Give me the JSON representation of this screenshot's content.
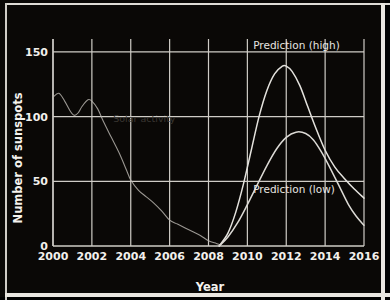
{
  "chart_data": {
    "type": "line",
    "title": "",
    "xlabel": "Year",
    "ylabel": "Number of sunspots",
    "xlim": [
      2000,
      2016
    ],
    "ylim": [
      0,
      160
    ],
    "xticks": [
      "2000",
      "2002",
      "2004",
      "2006",
      "2008",
      "2010",
      "2012",
      "2014",
      "2016"
    ],
    "xtick_values": [
      2000,
      2002,
      2004,
      2006,
      2008,
      2010,
      2012,
      2014,
      2016
    ],
    "yticks": [
      "0",
      "50",
      "100",
      "150"
    ],
    "ytick_values": [
      0,
      50,
      100,
      150
    ],
    "grid": true,
    "legend": "inline-annotations",
    "series": [
      {
        "name": "Solar activity",
        "color": "#b9b6b0",
        "annotation": "Solar activity",
        "annotation_x": 2003.1,
        "annotation_y": 96,
        "x": [
          2000.0,
          2000.3,
          2000.6,
          2000.9,
          2001.1,
          2001.3,
          2001.5,
          2001.8,
          2002.0,
          2002.3,
          2002.6,
          2003.0,
          2003.4,
          2003.8,
          2004.0,
          2004.4,
          2004.8,
          2005.2,
          2005.6,
          2006.0,
          2006.4,
          2006.8,
          2007.2,
          2007.6,
          2008.0,
          2008.4,
          2008.6
        ],
        "y": [
          115,
          118,
          112,
          104,
          101,
          103,
          108,
          113,
          112,
          106,
          96,
          84,
          72,
          58,
          51,
          43,
          38,
          33,
          27,
          20,
          17,
          14,
          11,
          8,
          4,
          2,
          1
        ]
      },
      {
        "name": "Prediction (high)",
        "color": "#e4e2dd",
        "annotation": "Prediction (high)",
        "annotation_x": 2010.3,
        "annotation_y": 152,
        "x": [
          2008.55,
          2009.0,
          2009.4,
          2009.8,
          2010.2,
          2010.6,
          2011.0,
          2011.4,
          2011.8,
          2012.0,
          2012.3,
          2012.7,
          2013.1,
          2013.5,
          2014.0,
          2014.5,
          2015.0,
          2015.5,
          2016.0
        ],
        "y": [
          0,
          10,
          26,
          48,
          74,
          100,
          120,
          133,
          139,
          139,
          135,
          124,
          108,
          92,
          74,
          61,
          52,
          44,
          37
        ]
      },
      {
        "name": "Prediction (low)",
        "color": "#dcdad5",
        "annotation": "Prediction (low)",
        "annotation_x": 2010.3,
        "annotation_y": 41,
        "x": [
          2008.55,
          2009.0,
          2009.5,
          2010.0,
          2010.5,
          2011.0,
          2011.5,
          2012.0,
          2012.5,
          2013.0,
          2013.4,
          2013.8,
          2014.2,
          2014.7,
          2015.2,
          2015.6,
          2016.0
        ],
        "y": [
          0,
          7,
          18,
          32,
          47,
          62,
          75,
          84,
          88,
          87,
          82,
          73,
          62,
          47,
          32,
          23,
          16
        ]
      }
    ]
  },
  "axes": {
    "x_title": "Year",
    "y_title": "Number of sunspots"
  },
  "colors": {
    "background": "#0a0806",
    "grid": "#cfccc6",
    "text": "#f2f0ec",
    "curve_light": "#e4e2dd",
    "curve_faint": "#b9b6b0"
  }
}
